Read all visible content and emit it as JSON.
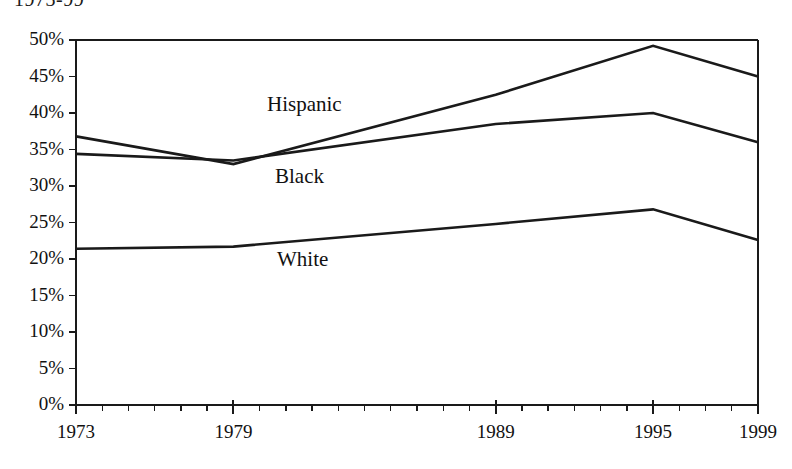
{
  "caption": {
    "text": "1973-99"
  },
  "chart_data": {
    "type": "line",
    "title": "",
    "subtitle": "",
    "xlabel": "",
    "ylabel": "",
    "x": [
      1973,
      1979,
      1989,
      1995,
      1999
    ],
    "categories": [
      "1973",
      "1979",
      "1989",
      "1995",
      "1999"
    ],
    "series": [
      {
        "name": "Hispanic",
        "values": [
          36.8,
          33.0,
          42.5,
          49.2,
          45.0
        ],
        "color": "#1a1a1a"
      },
      {
        "name": "Black",
        "values": [
          34.4,
          33.5,
          38.5,
          40.0,
          36.0
        ],
        "color": "#1a1a1a"
      },
      {
        "name": "White",
        "values": [
          21.4,
          21.7,
          24.8,
          26.8,
          22.6
        ],
        "color": "#1a1a1a"
      }
    ],
    "xlim": [
      1973,
      1999
    ],
    "ylim": [
      0,
      50
    ],
    "ytick_values": [
      50,
      45,
      40,
      35,
      30,
      25,
      20,
      15,
      10,
      5,
      0
    ],
    "ytick_labels": [
      "50%",
      "45%",
      "40%",
      "35%",
      "30%",
      "25%",
      "20%",
      "15%",
      "10%",
      "5%",
      "0%"
    ],
    "xtick_labels": [
      "1973",
      "1979",
      "1989",
      "1995",
      "1999"
    ],
    "xtick_minor_step_years": 1,
    "grid": false,
    "legend_position": "inline-annotations",
    "annotations": [
      {
        "text": "Hispanic",
        "x_px": 267,
        "y_px": 92
      },
      {
        "text": "Black",
        "x_px": 275,
        "y_px": 164
      },
      {
        "text": "White",
        "x_px": 277,
        "y_px": 247
      }
    ],
    "axis_color": "#1a1a1a",
    "background_color": "#ffffff"
  }
}
